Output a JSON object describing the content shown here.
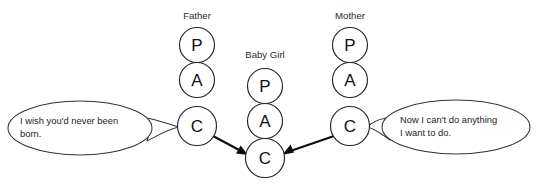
{
  "diagram": {
    "type": "ego-state-transaction",
    "background_color": "#ffffff",
    "stroke_color": "#262626",
    "text_color": "#1a1a1a",
    "columns": [
      {
        "id": "father",
        "label": "Father",
        "label_x": 197,
        "label_y": 19,
        "center_x": 197,
        "states": [
          {
            "code": "P",
            "name": "Parent",
            "cx": 197,
            "cy": 45,
            "r": 17.5
          },
          {
            "code": "A",
            "name": "Adult",
            "cx": 197,
            "cy": 80,
            "r": 17.5
          },
          {
            "code": "C",
            "name": "Child",
            "cx": 197,
            "cy": 126,
            "r": 19.5
          }
        ]
      },
      {
        "id": "baby-girl",
        "label": "Baby Girl",
        "label_x": 265,
        "label_y": 58,
        "center_x": 265,
        "states": [
          {
            "code": "P",
            "name": "Parent",
            "cx": 265,
            "cy": 86,
            "r": 17.5
          },
          {
            "code": "A",
            "name": "Adult",
            "cx": 265,
            "cy": 121,
            "r": 17.5
          },
          {
            "code": "C",
            "name": "Child",
            "cx": 265,
            "cy": 158,
            "r": 19.5
          }
        ]
      },
      {
        "id": "mother",
        "label": "Mother",
        "label_x": 350,
        "label_y": 19,
        "center_x": 350,
        "states": [
          {
            "code": "P",
            "name": "Parent",
            "cx": 350,
            "cy": 45,
            "r": 17.5
          },
          {
            "code": "A",
            "name": "Adult",
            "cx": 350,
            "cy": 80,
            "r": 17.5
          },
          {
            "code": "C",
            "name": "Child",
            "cx": 350,
            "cy": 126,
            "r": 19.5
          }
        ]
      }
    ],
    "bubbles": [
      {
        "id": "father-statement",
        "speaker": "Father",
        "lines": [
          "I wish you'd never been",
          "born."
        ],
        "cx": 80,
        "cy": 128,
        "rx": 72,
        "ry": 27,
        "text_x": 20,
        "text_y": 124,
        "tail_from_x": 147,
        "tail_to_x": 178
      },
      {
        "id": "mother-statement",
        "speaker": "Mother",
        "lines": [
          "Now I can't do anything",
          "I want to do."
        ],
        "cx": 456,
        "cy": 127,
        "rx": 74,
        "ry": 27,
        "text_x": 400,
        "text_y": 123,
        "tail_from_x": 382,
        "tail_to_x": 370
      }
    ],
    "arrows": [
      {
        "id": "father-child-to-baby-child",
        "from": "father.C",
        "to": "baby-girl.C",
        "x1": 213,
        "y1": 136,
        "x2": 245,
        "y2": 153
      },
      {
        "id": "mother-child-to-baby-child",
        "from": "mother.C",
        "to": "baby-girl.C",
        "x1": 334,
        "y1": 136,
        "x2": 286,
        "y2": 153
      }
    ]
  }
}
